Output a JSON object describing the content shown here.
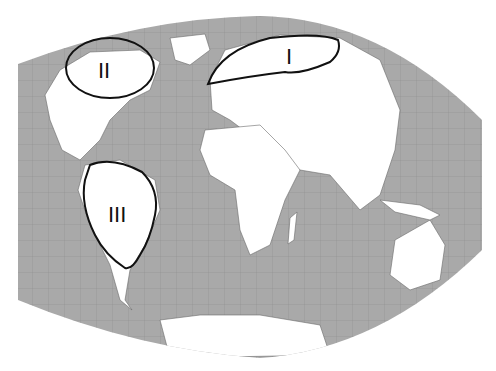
{
  "map": {
    "projection": "world-map-pseudocylindrical",
    "ocean_color": "#a9a9a9",
    "land_color": "#ffffff",
    "grid_color": "#8c8c8c",
    "outline_color": "#111111"
  },
  "regions": [
    {
      "id": "I",
      "label": "I",
      "description": "Northern Eurasia (Scandinavia to Siberia)"
    },
    {
      "id": "II",
      "label": "II",
      "description": "Northern North America (Canada)"
    },
    {
      "id": "III",
      "label": "III",
      "description": "South America (Amazon basin)"
    }
  ]
}
